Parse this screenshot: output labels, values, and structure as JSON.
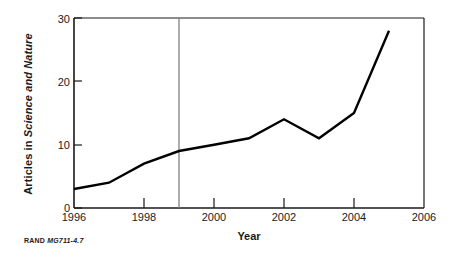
{
  "chart_data": {
    "type": "line",
    "title": "",
    "xlabel": "Year",
    "ylabel_plain": "Articles in ",
    "ylabel_italic": "Science and Nature",
    "ylabel_full": "Articles in Science and Nature",
    "x": [
      1996,
      1997,
      1998,
      1999,
      2000,
      2001,
      2002,
      2003,
      2004,
      2005
    ],
    "values": [
      3,
      4,
      7,
      9,
      10,
      11,
      14,
      11,
      15,
      28
    ],
    "series": [
      {
        "name": "Articles in Science and Nature",
        "values": [
          3,
          4,
          7,
          9,
          10,
          11,
          14,
          11,
          15,
          28
        ]
      }
    ],
    "xlim": [
      1996,
      2006
    ],
    "ylim": [
      0,
      30
    ],
    "xticks": [
      1996,
      1998,
      2000,
      2002,
      2004,
      2006
    ],
    "xtick_labels": [
      "1996",
      "1998",
      "2000",
      "2002",
      "2004",
      "2006"
    ],
    "yticks": [
      0,
      10,
      20,
      30
    ],
    "ytick_labels": [
      "0",
      "10",
      "20",
      "30"
    ],
    "grid": false,
    "legend": "none",
    "line_color": "#000000",
    "annotations": [
      {
        "type": "vertical-line",
        "x": 1999,
        "color": "#808080",
        "label": ""
      }
    ]
  },
  "footer": {
    "org": "RAND",
    "code": "MG711-4.7"
  }
}
